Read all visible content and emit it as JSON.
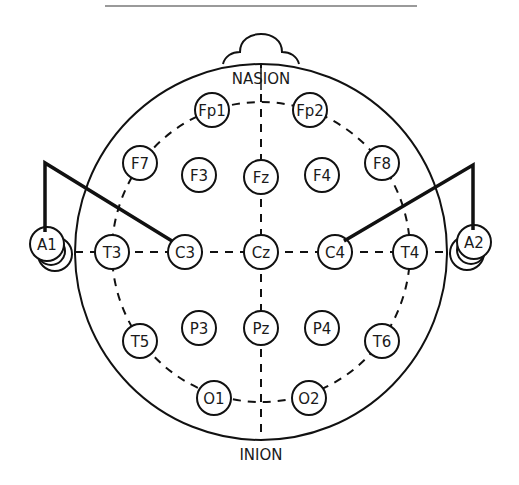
{
  "landmarks": {
    "nasion": "NASION",
    "inion": "INION"
  },
  "electrodes": [
    {
      "id": "Fp1",
      "x": 212,
      "y": 110
    },
    {
      "id": "Fp2",
      "x": 310,
      "y": 110
    },
    {
      "id": "F7",
      "x": 140,
      "y": 163
    },
    {
      "id": "F3",
      "x": 199,
      "y": 175
    },
    {
      "id": "Fz",
      "x": 261,
      "y": 177
    },
    {
      "id": "F4",
      "x": 322,
      "y": 175
    },
    {
      "id": "F8",
      "x": 382,
      "y": 163
    },
    {
      "id": "A1",
      "x": 47,
      "y": 244
    },
    {
      "id": "T3",
      "x": 112,
      "y": 252
    },
    {
      "id": "C3",
      "x": 185,
      "y": 252
    },
    {
      "id": "Cz",
      "x": 261,
      "y": 252
    },
    {
      "id": "C4",
      "x": 335,
      "y": 252
    },
    {
      "id": "T4",
      "x": 410,
      "y": 252
    },
    {
      "id": "A2",
      "x": 474,
      "y": 242
    },
    {
      "id": "T5",
      "x": 140,
      "y": 341
    },
    {
      "id": "P3",
      "x": 199,
      "y": 328
    },
    {
      "id": "Pz",
      "x": 261,
      "y": 328
    },
    {
      "id": "P4",
      "x": 322,
      "y": 328
    },
    {
      "id": "T6",
      "x": 382,
      "y": 341
    },
    {
      "id": "O1",
      "x": 214,
      "y": 398
    },
    {
      "id": "O2",
      "x": 309,
      "y": 398
    }
  ],
  "connections": [
    {
      "from": "A1",
      "to": "C3"
    },
    {
      "from": "A2",
      "to": "C4"
    }
  ],
  "colors": {
    "stroke": "#111111",
    "separator": "#9a9a9a",
    "background": "#ffffff"
  }
}
